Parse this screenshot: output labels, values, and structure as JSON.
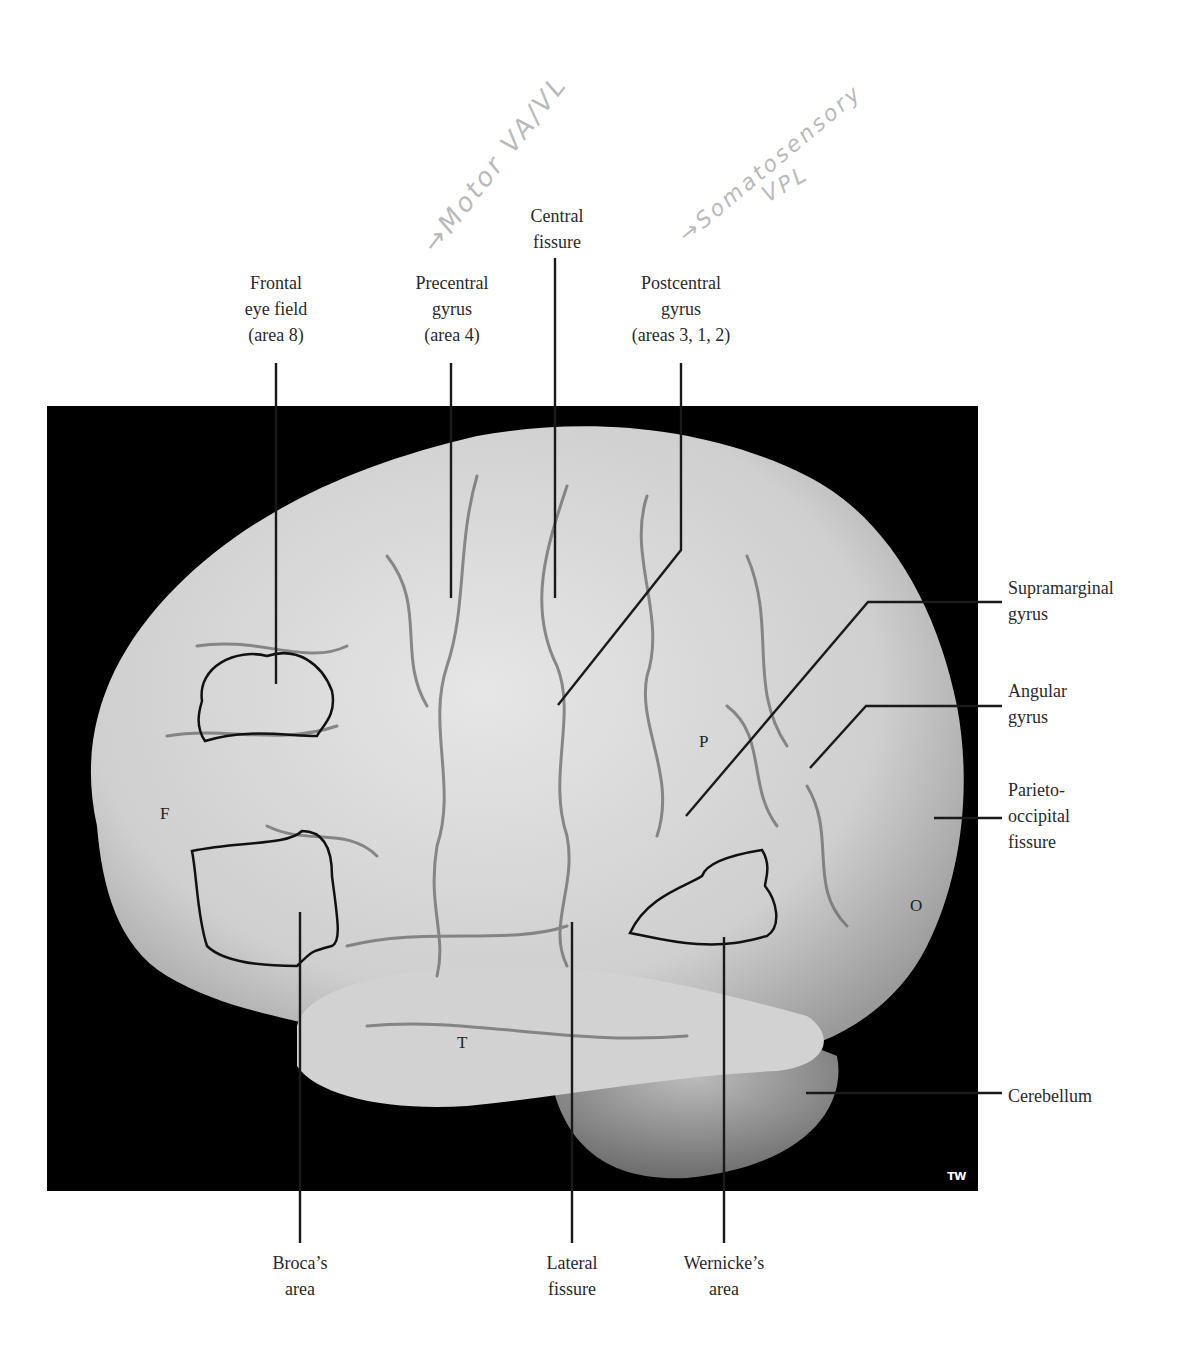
{
  "figure": {
    "photo_credit_mark": "TW",
    "colors": {
      "background": "#ffffff",
      "photo_background": "#000000",
      "brain_fill": "#d9d9d9",
      "leader_line": "#1a1a1a",
      "handwriting": "#b9b9b9"
    }
  },
  "labels_top": {
    "frontal_eye_field": [
      "Frontal",
      "eye field",
      "(area 8)"
    ],
    "precentral_gyrus": [
      "Precentral",
      "gyrus",
      "(area 4)"
    ],
    "central_fissure": [
      "Central",
      "fissure"
    ],
    "postcentral_gyrus": [
      "Postcentral",
      "gyrus",
      "(areas 3, 1, 2)"
    ]
  },
  "labels_right": {
    "supramarginal_gyrus": [
      "Supramarginal",
      "gyrus"
    ],
    "angular_gyrus": [
      "Angular",
      "gyrus"
    ],
    "parieto_occipital_fissure": [
      "Parieto-",
      "occipital",
      "fissure"
    ],
    "cerebellum": [
      "Cerebellum"
    ]
  },
  "labels_bottom": {
    "brocas_area": [
      "Broca’s",
      "area"
    ],
    "lateral_fissure": [
      "Lateral",
      "fissure"
    ],
    "wernickes_area": [
      "Wernicke’s",
      "area"
    ]
  },
  "region_letters": {
    "frontal": "F",
    "parietal": "P",
    "temporal": "T",
    "occipital": "O"
  },
  "handwritten_notes": {
    "motor": "→Motor VA/VL",
    "somatosensory": "→Somatosensory",
    "somatosensory_sub": "VPL"
  }
}
